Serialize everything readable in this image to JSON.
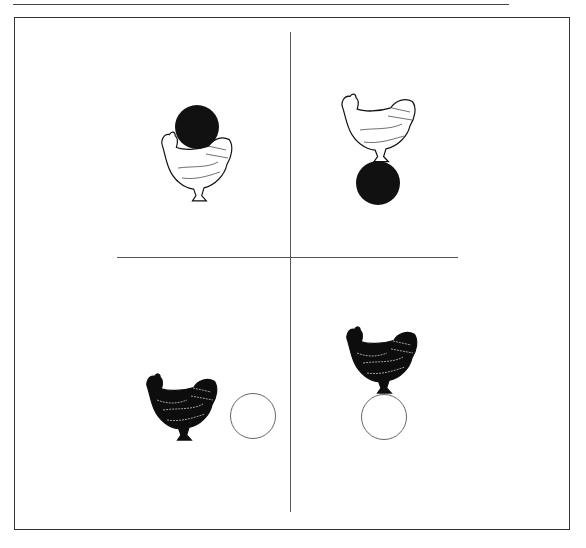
{
  "figure": {
    "quadrants": [
      {
        "id": "top-left",
        "hen": "white",
        "circle": "filled-black",
        "circle_position": "above-hen"
      },
      {
        "id": "top-right",
        "hen": "white",
        "circle": "filled-black",
        "circle_position": "below-hen"
      },
      {
        "id": "bottom-left",
        "hen": "black",
        "circle": "open-white",
        "circle_position": "right-of-hen"
      },
      {
        "id": "bottom-right",
        "hen": "black",
        "circle": "open-white",
        "circle_position": "below-hen"
      }
    ]
  },
  "colors": {
    "line": "#555555",
    "frame": "#333333",
    "filled_circle": "#111111",
    "black_hen": "#0d0d0d",
    "white_hen": "#ffffff"
  }
}
